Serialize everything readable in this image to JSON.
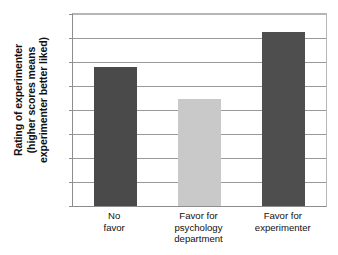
{
  "chart_data": {
    "type": "bar",
    "title": "",
    "subtitle": "",
    "xlabel": "",
    "ylabel": "Rating of experimenter (higher scores means experimenter better liked)",
    "ylabel_lines": [
      "Rating of experimenter",
      "(higher scores means",
      "experimenter better liked)"
    ],
    "categories": [
      "No favor",
      "Favor for psychology department",
      "Favor for experimenter"
    ],
    "category_lines": [
      [
        "No",
        "favor"
      ],
      [
        "Favor for",
        "psychology",
        "department"
      ],
      [
        "Favor for",
        "experimenter"
      ]
    ],
    "values": [
      5.8,
      4.45,
      7.25
    ],
    "ylim": [
      0,
      8
    ],
    "ytick_labels": [
      "0",
      "1",
      "2",
      "3",
      "4",
      "5",
      "6",
      "7",
      "8"
    ],
    "ytick_values": [
      0,
      1,
      2,
      3,
      4,
      5,
      6,
      7,
      8
    ],
    "grid": true,
    "legend": false,
    "bar_colors": [
      "#4a4a4a",
      "#c9c9c9",
      "#4e4e4e"
    ],
    "colors": {
      "axis": "#8d8d8d",
      "gridline": "#9a9a9a",
      "frame": "#b6b6b6",
      "text": "#111111",
      "plot_background": "#ffffff"
    }
  }
}
